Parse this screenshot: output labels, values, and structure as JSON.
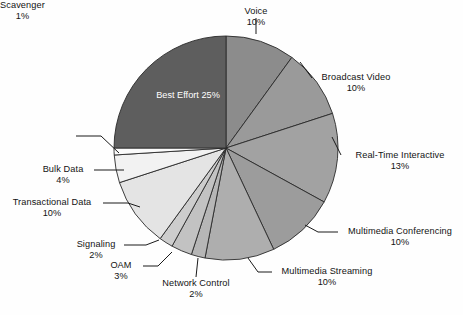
{
  "chart_data": {
    "type": "pie",
    "title": "",
    "subtitle": "",
    "xlabel": "",
    "ylabel": "",
    "legend_position": "none",
    "grid": false,
    "value_unit": "%",
    "start_angle_deg": 0,
    "direction": "clockwise",
    "categories": [
      "Voice",
      "Broadcast Video",
      "Real-Time Interactive",
      "Multimedia Conferencing",
      "Multimedia Streaming",
      "Network Control",
      "OAM",
      "Signaling",
      "Transactional Data",
      "Bulk Data",
      "Scavenger",
      "Best Effort"
    ],
    "values": [
      10,
      10,
      13,
      10,
      10,
      2,
      3,
      2,
      10,
      4,
      1,
      25
    ],
    "labels": [
      "10%",
      "10%",
      "13%",
      "10%",
      "10%",
      "2%",
      "3%",
      "2%",
      "10%",
      "4%",
      "1%",
      "25%"
    ],
    "colors": [
      "#8c8c8c",
      "#9a9a9a",
      "#a2a2a2",
      "#9c9c9c",
      "#aeaeae",
      "#b6b6b6",
      "#c2c2c2",
      "#cdcdcd",
      "#e4e4e4",
      "#f2f2f2",
      "#fbfbfb",
      "#5e5e5e"
    ]
  },
  "slices": [
    {
      "name": "Voice",
      "value": 10,
      "percent_label": "10%",
      "color": "#8c8c8c",
      "label_placement": "outside-top",
      "label_align": "center"
    },
    {
      "name": "Broadcast Video",
      "value": 10,
      "percent_label": "10%",
      "color": "#9a9a9a",
      "label_placement": "outside-right",
      "label_align": "center"
    },
    {
      "name": "Real-Time Interactive",
      "value": 13,
      "percent_label": "13%",
      "color": "#a2a2a2",
      "label_placement": "outside-right",
      "label_align": "center"
    },
    {
      "name": "Multimedia Conferencing",
      "value": 10,
      "percent_label": "10%",
      "color": "#9c9c9c",
      "label_placement": "outside-right",
      "label_align": "center"
    },
    {
      "name": "Multimedia Streaming",
      "value": 10,
      "percent_label": "10%",
      "color": "#aeaeae",
      "label_placement": "outside-bottom-right",
      "label_align": "center"
    },
    {
      "name": "Network Control",
      "value": 2,
      "percent_label": "2%",
      "color": "#b6b6b6",
      "label_placement": "outside-bottom",
      "label_align": "center"
    },
    {
      "name": "OAM",
      "value": 3,
      "percent_label": "3%",
      "color": "#c2c2c2",
      "label_placement": "outside-bottom-left",
      "label_align": "center"
    },
    {
      "name": "Signaling",
      "value": 2,
      "percent_label": "2%",
      "color": "#cdcdcd",
      "label_placement": "outside-left",
      "label_align": "center"
    },
    {
      "name": "Transactional Data",
      "value": 10,
      "percent_label": "10%",
      "color": "#e4e4e4",
      "label_placement": "outside-left",
      "label_align": "center"
    },
    {
      "name": "Bulk Data",
      "value": 4,
      "percent_label": "4%",
      "color": "#f2f2f2",
      "label_placement": "outside-left",
      "label_align": "center"
    },
    {
      "name": "Scavenger",
      "value": 1,
      "percent_label": "1%",
      "color": "#fbfbfb",
      "label_placement": "outside-upper-left",
      "label_align": "center"
    },
    {
      "name": "Best Effort",
      "value": 25,
      "percent_label": "25%",
      "color": "#5e5e5e",
      "label_placement": "inside",
      "label_align": "center"
    }
  ]
}
